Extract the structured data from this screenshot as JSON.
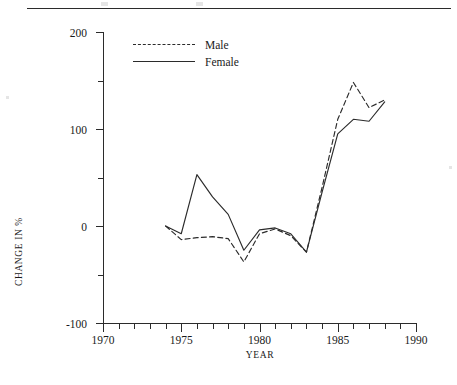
{
  "figure": {
    "ylabel": "CHANGE IN %",
    "xlabel": "YEAR"
  },
  "legend": {
    "items": [
      {
        "label": "Male",
        "style": "dashed"
      },
      {
        "label": "Female",
        "style": "solid"
      }
    ]
  },
  "axes": {
    "y_ticks_major": [
      "200",
      "100",
      "0",
      "-100"
    ],
    "y_ticks_major_values": [
      200,
      100,
      0,
      -100
    ],
    "y_ticks_minor_values": [
      150,
      50,
      -50
    ],
    "x_ticks_major": [
      "1970",
      "1975",
      "1980",
      "1985",
      "1990"
    ],
    "x_ticks_major_values": [
      1970,
      1975,
      1980,
      1985,
      1990
    ]
  },
  "chart_data": {
    "type": "line",
    "title": "",
    "xlabel": "YEAR",
    "ylabel": "CHANGE IN %",
    "xlim": [
      1970,
      1990
    ],
    "ylim": [
      -100,
      200
    ],
    "grid": false,
    "legend_position": "top-left-inside",
    "x": [
      1974,
      1975,
      1976,
      1977,
      1978,
      1979,
      1980,
      1981,
      1982,
      1983,
      1984,
      1985,
      1986,
      1987,
      1988
    ],
    "series": [
      {
        "name": "Male",
        "style": "dashed",
        "color": "#2b2b2b",
        "values": [
          0,
          -14,
          -12,
          -11,
          -13,
          -37,
          -8,
          -3,
          -10,
          -27,
          40,
          110,
          148,
          122,
          130
        ]
      },
      {
        "name": "Female",
        "style": "solid",
        "color": "#2b2b2b",
        "values": [
          0,
          -8,
          53,
          30,
          12,
          -25,
          -4,
          -2,
          -8,
          -27,
          35,
          95,
          110,
          108,
          128
        ]
      }
    ]
  }
}
